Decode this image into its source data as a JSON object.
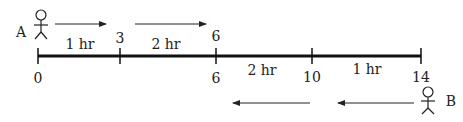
{
  "persons": {
    "a": {
      "label": "A"
    },
    "b": {
      "label": "B"
    }
  },
  "top_ticks": [
    {
      "label": "3",
      "x": 120
    },
    {
      "label": "6",
      "x": 216
    }
  ],
  "bottom_ticks": [
    {
      "label": "0",
      "x": 38
    },
    {
      "label": "6",
      "x": 216
    },
    {
      "label": "10",
      "x": 312
    },
    {
      "label": "14",
      "x": 421
    }
  ],
  "segments_top": [
    {
      "label": "1 hr",
      "x": 79
    },
    {
      "label": "2 hr",
      "x": 168
    }
  ],
  "segments_bottom": [
    {
      "label": "2 hr",
      "x": 262
    },
    {
      "label": "1 hr",
      "x": 368
    }
  ]
}
